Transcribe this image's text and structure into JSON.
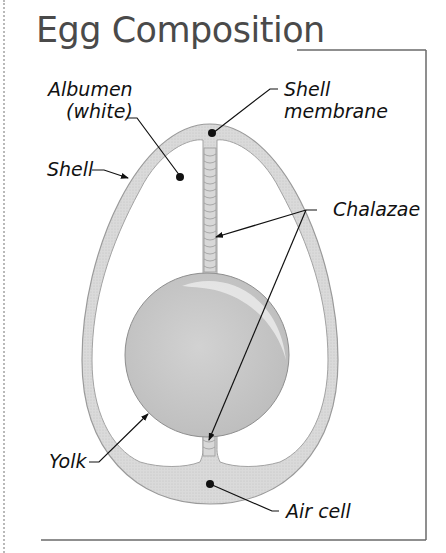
{
  "title": "Egg Composition",
  "labels": {
    "albumen_line1": "Albumen",
    "albumen_line2": "(white)",
    "shell": "Shell",
    "shell_membrane_line1": "Shell",
    "shell_membrane_line2": "membrane",
    "chalazae": "Chalazae",
    "yolk": "Yolk",
    "air_cell": "Air cell"
  },
  "colors": {
    "shell_fill": "#d6d6d6",
    "shell_stroke": "#9a9a9a",
    "yolk_fill": "#c8c8c8",
    "yolk_highlight": "#e6e6e6",
    "frame": "#6a6a6a",
    "leader": "#111111",
    "title": "#4a4a4a"
  }
}
